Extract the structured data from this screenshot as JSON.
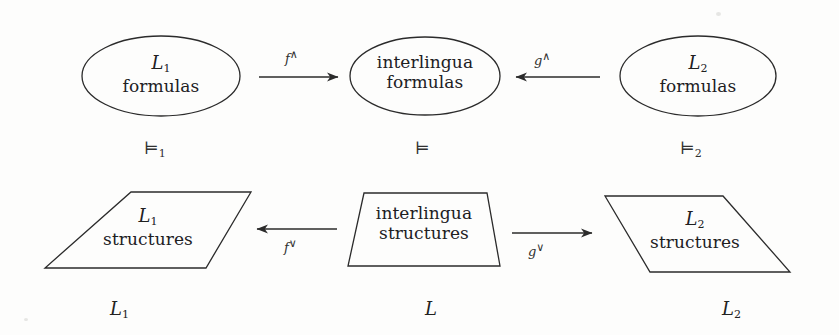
{
  "diagram": {
    "stroke_color": "#2b2b2b",
    "background": "#fdfdfc",
    "top_row": {
      "left": {
        "shape": "ellipse",
        "line1": "L",
        "line1_sub": "1",
        "line2": "formulas"
      },
      "center": {
        "shape": "ellipse",
        "line1": "interlingua",
        "line2": "formulas"
      },
      "right": {
        "shape": "ellipse",
        "line1": "L",
        "line1_sub": "2",
        "line2": "formulas"
      }
    },
    "bottom_row": {
      "left": {
        "shape": "parallelogram",
        "line1": "L",
        "line1_sub": "1",
        "line2": "structures"
      },
      "center": {
        "shape": "trapezoid",
        "line1": "interlingua",
        "line2": "structures"
      },
      "right": {
        "shape": "parallelogram",
        "line1": "L",
        "line1_sub": "2",
        "line2": "structures"
      }
    },
    "arrows": [
      {
        "name": "f-up",
        "label_base": "f",
        "label_sup": "∧",
        "direction": "right",
        "row": "top"
      },
      {
        "name": "g-up",
        "label_base": "g",
        "label_sup": "∧",
        "direction": "left",
        "row": "top"
      },
      {
        "name": "f-down",
        "label_base": "f",
        "label_sup": "∨",
        "direction": "left",
        "row": "bottom"
      },
      {
        "name": "g-down",
        "label_base": "g",
        "label_sup": "∨",
        "direction": "right",
        "row": "bottom"
      }
    ],
    "satisfaction": [
      {
        "name": "models-1",
        "symbol": "⊨",
        "sub": "1"
      },
      {
        "name": "models",
        "symbol": "⊨",
        "sub": ""
      },
      {
        "name": "models-2",
        "symbol": "⊨",
        "sub": "2"
      }
    ],
    "bottom_captions": [
      {
        "name": "caption-l1",
        "base": "L",
        "sub": "1"
      },
      {
        "name": "caption-l",
        "base": "L",
        "sub": ""
      },
      {
        "name": "caption-l2",
        "base": "L",
        "sub": "2"
      }
    ]
  }
}
